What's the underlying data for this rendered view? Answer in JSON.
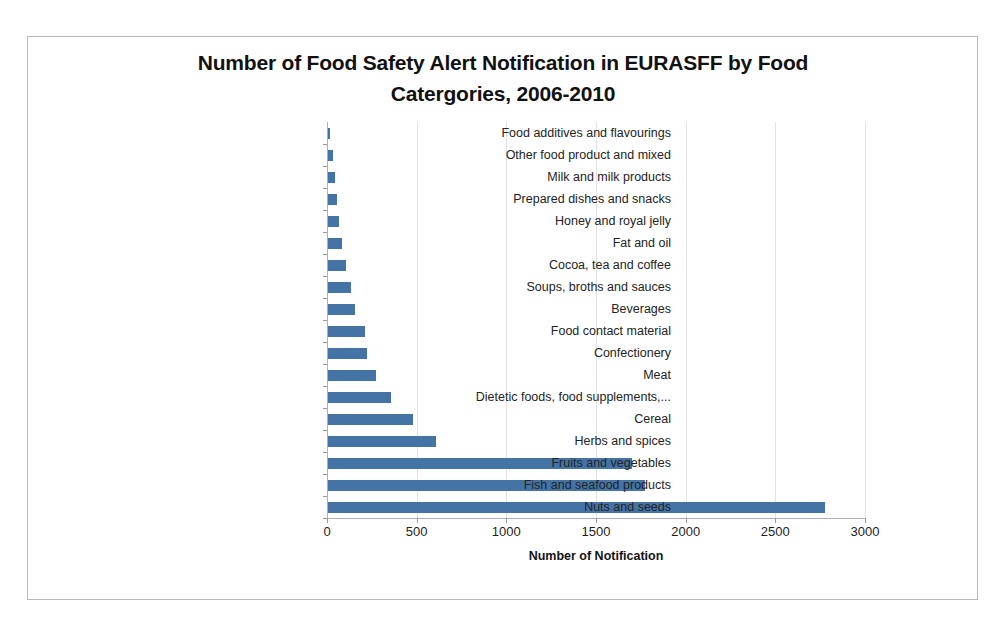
{
  "chart_data": {
    "type": "bar",
    "orientation": "horizontal",
    "title": "Number of Food Safety Alert Notification in EURASFF by Food Catergories, 2006-2010",
    "title_line1": "Number of Food Safety Alert Notification in EURASFF by Food",
    "title_line2": "Catergories, 2006-2010",
    "xlabel": "Number of Notification",
    "ylabel": "",
    "xlim": [
      0,
      3000
    ],
    "xticks": [
      0,
      500,
      1000,
      1500,
      2000,
      2500,
      3000
    ],
    "xtick_labels": [
      "0",
      "500",
      "1000",
      "1500",
      "2000",
      "2500",
      "3000"
    ],
    "grid": "vertical-major",
    "legend": "none",
    "bar_color": "#4474A6",
    "gridline_color": "#E2E2E2",
    "axis_color": "#B0B0B0",
    "categories": [
      "Food additives and flavourings",
      "Other food product and mixed",
      "Milk and milk products",
      "Prepared dishes and snacks",
      "Honey and royal jelly",
      "Fat and oil",
      "Cocoa, tea and coffee",
      "Soups, broths and sauces",
      "Beverages",
      "Food contact material",
      "Confectionery",
      "Meat",
      "Dietetic foods, food supplements,...",
      "Cereal",
      "Herbs and spices",
      "Fruits and vegetables",
      "Fish and seafood products",
      "Nuts and seeds"
    ],
    "values": [
      12,
      30,
      38,
      48,
      62,
      80,
      100,
      130,
      148,
      205,
      215,
      265,
      350,
      475,
      600,
      1695,
      1770,
      2770
    ]
  }
}
